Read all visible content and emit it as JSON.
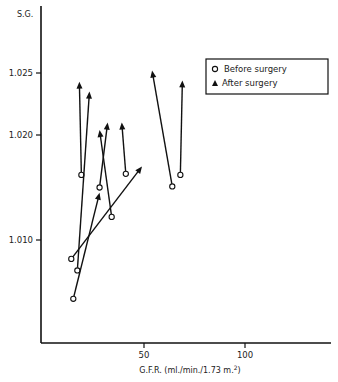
{
  "chart_data": {
    "type": "scatter",
    "title": "",
    "xlabel": "G.F.R. (ml./min./1.73 m.²)",
    "ylabel": "S.G.",
    "x_ticks": [
      50,
      100
    ],
    "y_ticks": [
      "1.010",
      "1.020",
      "1.025"
    ],
    "xlim": [
      0,
      142
    ],
    "ylim": [
      1.0,
      1.029
    ],
    "grid": false,
    "legend_position": "upper right",
    "legend": [
      {
        "marker": "open-circle",
        "label": "Before surgery"
      },
      {
        "marker": "filled-triangle",
        "label": "After surgery"
      }
    ],
    "series": [
      {
        "name": "Before surgery",
        "marker": "open-circle",
        "points": [
          [
            19,
            1.0162
          ],
          [
            17,
            1.0071
          ],
          [
            15,
            1.0044
          ],
          [
            14,
            1.0082
          ],
          [
            28,
            1.015
          ],
          [
            34,
            1.0122
          ],
          [
            41,
            1.0163
          ],
          [
            64,
            1.0151
          ],
          [
            68,
            1.0162
          ]
        ]
      },
      {
        "name": "After surgery",
        "marker": "filled-triangle",
        "points": [
          [
            18,
            1.0243
          ],
          [
            23,
            1.0235
          ],
          [
            28,
            1.0145
          ],
          [
            49,
            1.017
          ],
          [
            32,
            1.021
          ],
          [
            28,
            1.0204
          ],
          [
            39,
            1.021
          ],
          [
            54,
            1.0252
          ],
          [
            69,
            1.0244
          ]
        ]
      }
    ],
    "pairs": [
      {
        "before": [
          19,
          1.0162
        ],
        "after": [
          18,
          1.0243
        ]
      },
      {
        "before": [
          17,
          1.0071
        ],
        "after": [
          23,
          1.0235
        ]
      },
      {
        "before": [
          15,
          1.0044
        ],
        "after": [
          28,
          1.0145
        ]
      },
      {
        "before": [
          14,
          1.0082
        ],
        "after": [
          49,
          1.017
        ]
      },
      {
        "before": [
          28,
          1.015
        ],
        "after": [
          32,
          1.021
        ]
      },
      {
        "before": [
          34,
          1.0122
        ],
        "after": [
          28,
          1.0204
        ]
      },
      {
        "before": [
          41,
          1.0163
        ],
        "after": [
          39,
          1.021
        ]
      },
      {
        "before": [
          64,
          1.0151
        ],
        "after": [
          54,
          1.0252
        ]
      },
      {
        "before": [
          68,
          1.0162
        ],
        "after": [
          69,
          1.0244
        ]
      }
    ]
  },
  "axes": {
    "y_label": "S.G.",
    "x_label": "G.F.R. (ml./min./1.73 m.",
    "x_label_sup": "2",
    "x_label_end": ")",
    "y_tick_labels": [
      "1.025",
      "1.020",
      "1.010"
    ],
    "x_tick_labels": [
      "50",
      "100"
    ]
  },
  "legend": {
    "before_label": "Before surgery",
    "after_label": "After surgery"
  }
}
